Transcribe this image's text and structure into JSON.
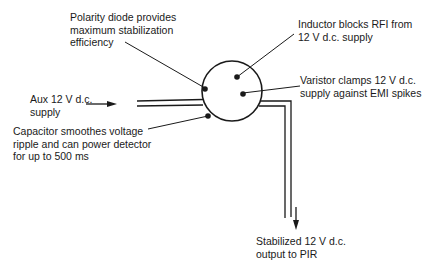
{
  "diagram": {
    "type": "PIR detector supply stabilizer connector",
    "component": {
      "shape": "circle",
      "pins": 4
    },
    "labels": {
      "polarity_diode": [
        "Polarity diode provides",
        "maximum stabilization",
        "efficiency"
      ],
      "inductor": [
        "Inductor blocks RFI from",
        "12 V d.c. supply"
      ],
      "varistor": [
        "Varistor clamps 12 V d.c.",
        "supply against EMI spikes"
      ],
      "aux_supply": [
        "Aux 12 V d.c.",
        "supply"
      ],
      "capacitor": [
        "Capacitor smoothes voltage",
        "ripple and can power detector",
        "for up to 500 ms"
      ],
      "output": [
        "Stabilized 12 V d.c.",
        "output to PIR"
      ]
    },
    "colors": {
      "stroke": "#1a1a1a",
      "background": "#ffffff"
    }
  }
}
